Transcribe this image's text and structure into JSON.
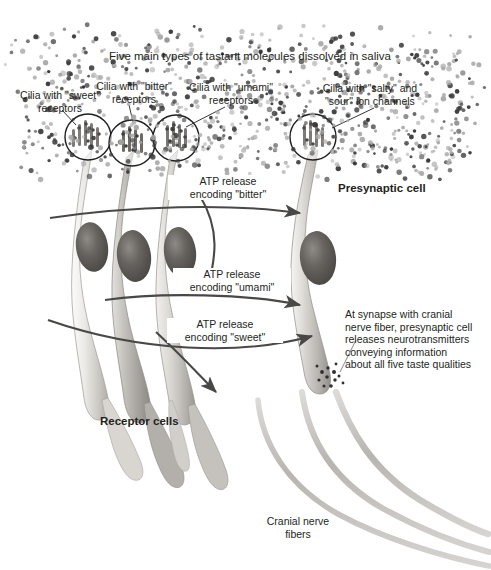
{
  "figure": {
    "domain": "biology-diagram",
    "background_color": "#ffffff",
    "ink_color": "#231f20",
    "cell_fill_light": "#e8e6e2",
    "cell_fill_mid": "#b9b6b1",
    "cell_fill_dark": "#8d8a86",
    "nucleus_color": "#5d5a57",
    "dot_color_dark": "#3a3a3a",
    "dot_color_light": "#a9a9a9",
    "arrow_color": "#4a4846",
    "nerve_color": "#bdbbb8"
  },
  "title": {
    "text": "Five main types of tastant molecules dissolved in saliva"
  },
  "cilia_labels": [
    {
      "id": "sweet",
      "line1": "Cilia with \"sweet\"",
      "line2": "receptors"
    },
    {
      "id": "bitter",
      "line1": "Cilia with \"bitter\"",
      "line2": "receptors"
    },
    {
      "id": "umami",
      "line1": "Cilia with \"umami\"",
      "line2": "receptors"
    },
    {
      "id": "salty-sour",
      "line1": "Cilia with \"salty\" and",
      "line2": "\"sour\" ion channels"
    }
  ],
  "atp_labels": [
    {
      "id": "bitter",
      "line1": "ATP release",
      "line2": "encoding \"bitter\""
    },
    {
      "id": "umami",
      "line1": "ATP release",
      "line2": "encoding \"umami\""
    },
    {
      "id": "sweet",
      "line1": "ATP release",
      "line2": "encoding \"sweet\""
    }
  ],
  "callouts": {
    "presynaptic_cell": "Presynaptic cell",
    "receptor_cells": "Receptor cells",
    "cranial_nerve_fibers": {
      "line1": "Cranial nerve",
      "line2": "fibers"
    },
    "synapse_note": {
      "line1": "At synapse with cranial",
      "line2": "nerve fiber, presynaptic cell",
      "line3": "releases neurotransmitters",
      "line4": "conveying information",
      "line5": "about all five taste qualities"
    }
  },
  "counts": {
    "receptor_cells": 3,
    "presynaptic_cells": 1,
    "circled_cilia_tufts": 4,
    "cranial_nerve_fibers": 3,
    "atp_arrows": 3
  }
}
